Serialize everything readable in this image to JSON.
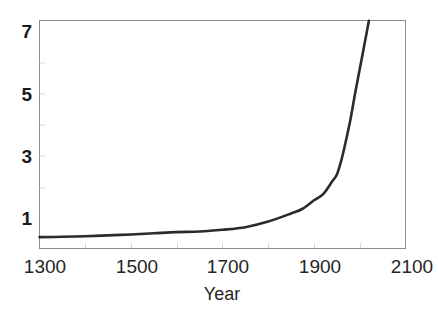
{
  "chart_data": {
    "type": "line",
    "title": "",
    "subtitle": "",
    "xlabel": "Year",
    "ylabel": "",
    "xlim": [
      1300,
      2100
    ],
    "ylim": [
      0,
      7.8
    ],
    "xticks": [
      1300,
      1500,
      1700,
      1900,
      2100
    ],
    "xtick_labels": [
      "1300",
      "1500",
      "1700",
      "1900",
      "2100"
    ],
    "yticks": [
      1,
      3,
      5,
      7
    ],
    "ytick_labels": [
      "1",
      "3",
      "5",
      "7"
    ],
    "grid": false,
    "legend": null,
    "legend_position": "none",
    "line_color": "#2b2b2b",
    "line_width": 2.6,
    "axis_color": "#808080",
    "background_color": "#ffffff",
    "series": [
      {
        "name": "World population (billions)",
        "x": [
          1300,
          1350,
          1400,
          1450,
          1500,
          1550,
          1600,
          1650,
          1700,
          1750,
          1800,
          1850,
          1875,
          1900,
          1920,
          1940,
          1950,
          1960,
          1970,
          1980,
          1990,
          2000,
          2010,
          2020
        ],
        "values": [
          0.39,
          0.4,
          0.42,
          0.45,
          0.48,
          0.52,
          0.56,
          0.58,
          0.64,
          0.73,
          0.92,
          1.2,
          1.36,
          1.65,
          1.86,
          2.3,
          2.53,
          3.03,
          3.7,
          4.44,
          5.32,
          6.14,
          6.96,
          7.79
        ]
      }
    ],
    "annotations": []
  },
  "axes": {
    "x_axis_name": "year-axis",
    "y_axis_name": "population-axis"
  }
}
